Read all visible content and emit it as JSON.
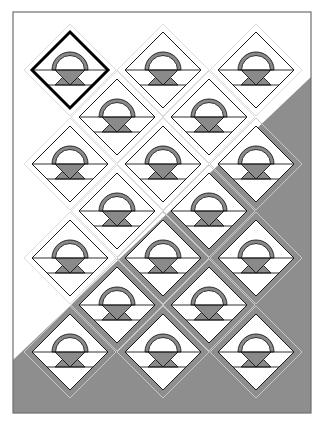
{
  "diagram": {
    "type": "quilt-layout",
    "pattern": "basket-blocks-on-point",
    "frame": {
      "x": 13,
      "y": 12,
      "width": 298,
      "height": 401
    },
    "colors": {
      "background": "#ffffff",
      "frame": "#6e6e6e",
      "corner_fill": "#8e8e8e",
      "basket_fill": "#8a8a8a",
      "block_stroke": "#1a1a1a",
      "sashing_line_light": "#dcdcdc",
      "sashing_line_on_gray": "#c8c8c8",
      "selected_stroke": "#000000"
    },
    "corner_polygon": [
      [
        13,
        360
      ],
      [
        311,
        77
      ],
      [
        311,
        413
      ],
      [
        13,
        413
      ]
    ],
    "block_half_size": 38,
    "outline_half_size": 46,
    "selected_block_index": 0,
    "blocks": [
      {
        "row": 1,
        "cx": 70,
        "cy": 70
      },
      {
        "row": 1,
        "cx": 163,
        "cy": 70
      },
      {
        "row": 1,
        "cx": 256,
        "cy": 70
      },
      {
        "row": 2,
        "cx": 117,
        "cy": 117
      },
      {
        "row": 2,
        "cx": 209,
        "cy": 117
      },
      {
        "row": 3,
        "cx": 70,
        "cy": 164
      },
      {
        "row": 3,
        "cx": 163,
        "cy": 164
      },
      {
        "row": 3,
        "cx": 256,
        "cy": 164
      },
      {
        "row": 4,
        "cx": 117,
        "cy": 211
      },
      {
        "row": 4,
        "cx": 209,
        "cy": 211
      },
      {
        "row": 5,
        "cx": 70,
        "cy": 258
      },
      {
        "row": 5,
        "cx": 163,
        "cy": 258
      },
      {
        "row": 5,
        "cx": 256,
        "cy": 258
      },
      {
        "row": 6,
        "cx": 117,
        "cy": 305
      },
      {
        "row": 6,
        "cx": 209,
        "cy": 305
      },
      {
        "row": 7,
        "cx": 70,
        "cy": 352
      },
      {
        "row": 7,
        "cx": 163,
        "cy": 352
      },
      {
        "row": 7,
        "cx": 256,
        "cy": 352
      }
    ]
  }
}
